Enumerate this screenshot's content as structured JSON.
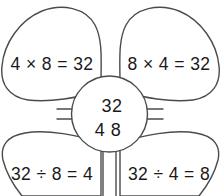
{
  "diagram": {
    "stroke_color": "#4b4b4b",
    "text_color": "#1a1a1a",
    "background_color": "#ffffff",
    "center": {
      "product": "32",
      "factors": "4  8",
      "factor_a": "4",
      "factor_b": "8"
    },
    "petals": [
      {
        "position": "top-left",
        "equation": "4 × 8 = 32",
        "operation": "multiplication"
      },
      {
        "position": "top-right",
        "equation": "8 × 4 = 32",
        "operation": "multiplication"
      },
      {
        "position": "bottom-left",
        "equation": "32 ÷ 8 = 4",
        "operation": "division"
      },
      {
        "position": "bottom-right",
        "equation": "32 ÷ 4 = 8",
        "operation": "division"
      }
    ]
  }
}
